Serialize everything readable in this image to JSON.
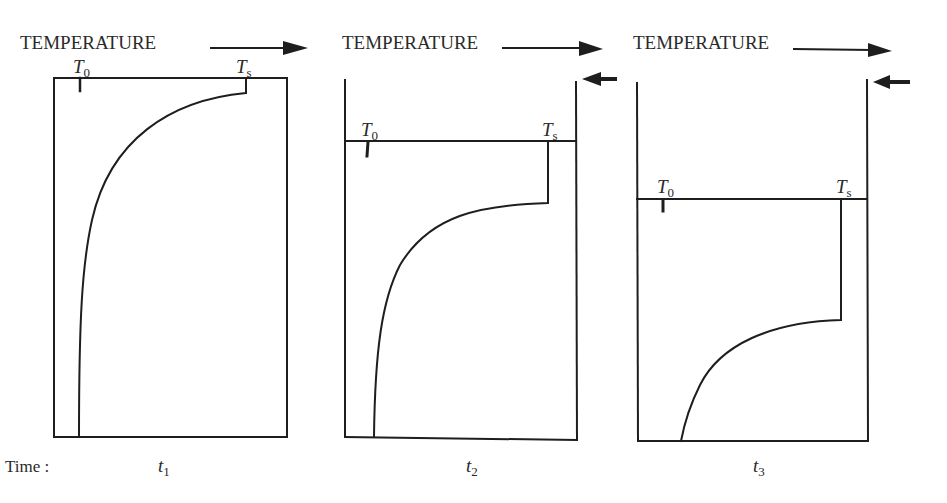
{
  "figure": {
    "time_label": "Time :",
    "panels": [
      {
        "id": "p1",
        "header": "TEMPERATURE",
        "t0_symbol": "T",
        "t0_sub": "0",
        "ts_symbol": "T",
        "ts_sub": "s",
        "time_symbol": "t",
        "time_sub": "1",
        "has_surface_arrow": false
      },
      {
        "id": "p2",
        "header": "TEMPERATURE",
        "t0_symbol": "T",
        "t0_sub": "0",
        "ts_symbol": "T",
        "ts_sub": "s",
        "time_symbol": "t",
        "time_sub": "2",
        "has_surface_arrow": true
      },
      {
        "id": "p3",
        "header": "TEMPERATURE",
        "t0_symbol": "T",
        "t0_sub": "0",
        "ts_symbol": "T",
        "ts_sub": "s",
        "time_symbol": "t",
        "time_sub": "3",
        "has_surface_arrow": true
      }
    ],
    "icons": {
      "temperature_axis_arrow": "right-arrow",
      "surface_recession_arrow": "left-arrow"
    },
    "colors": {
      "ink": "#1e1e1e",
      "background": "#ffffff"
    }
  }
}
